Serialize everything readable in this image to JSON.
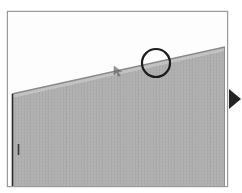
{
  "figure": {
    "caption_faint": "",
    "background_color": "#ffffff",
    "frame": {
      "name": "image-border-frame",
      "color": "#9a9a9a",
      "x": 7,
      "y": 11,
      "width": 221,
      "height": 176
    },
    "wall": {
      "name": "building-facade",
      "fill_color": "#b0b0b0",
      "stripe_color": "#a8a8a8",
      "edge_color": "#8a8a8a",
      "left_edge_color": "#2a2a2a",
      "roofline_label": "sloping roofline",
      "apex_x": 225,
      "apex_y": 47,
      "base_left_x": 12,
      "base_left_y": 94,
      "bottom_y": 186
    },
    "annotations": [
      {
        "name": "circle-annotation",
        "type": "circle",
        "cx": 156,
        "cy": 63,
        "r": 14,
        "stroke_color": "#1c1c1c",
        "stroke_width": 2.2
      },
      {
        "name": "cursor-mark",
        "type": "cursor",
        "x": 117,
        "y": 70,
        "color": "#555555"
      },
      {
        "name": "wall-tick-mark",
        "type": "tick",
        "x": 18,
        "y": 149,
        "height": 11,
        "color": "#3a3a3a"
      }
    ],
    "marker": {
      "name": "play-triangle-marker",
      "glyph": "right-pointing-triangle",
      "x": 228,
      "y": 89,
      "width": 12,
      "height": 20,
      "color": "#242424"
    }
  }
}
